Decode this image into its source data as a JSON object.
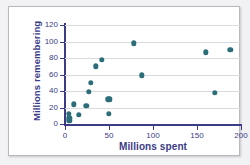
{
  "chart_data": {
    "type": "scatter",
    "title": "",
    "xlabel": "Millions spent",
    "ylabel": "Millions remembering",
    "xlim": [
      0,
      200
    ],
    "ylim": [
      0,
      120
    ],
    "xticks": [
      0,
      50,
      100,
      150,
      200
    ],
    "yticks": [
      0,
      20,
      40,
      60,
      80,
      100,
      120
    ],
    "grid": "horizontal",
    "legend": "none",
    "marker_color": "#2b6e79",
    "axis_color": "#3b3b86",
    "gridline_color": "#d9d9e0",
    "points": [
      {
        "x": 4,
        "y": 12
      },
      {
        "x": 5,
        "y": 7
      },
      {
        "x": 5,
        "y": 4
      },
      {
        "x": 10,
        "y": 24
      },
      {
        "x": 16,
        "y": 11
      },
      {
        "x": 24,
        "y": 22
      },
      {
        "x": 27,
        "y": 39
      },
      {
        "x": 29,
        "y": 50
      },
      {
        "x": 35,
        "y": 70
      },
      {
        "x": 42,
        "y": 78
      },
      {
        "x": 49,
        "y": 30
      },
      {
        "x": 51,
        "y": 30
      },
      {
        "x": 50,
        "y": 12
      },
      {
        "x": 78,
        "y": 98
      },
      {
        "x": 87,
        "y": 59
      },
      {
        "x": 160,
        "y": 87
      },
      {
        "x": 170,
        "y": 38
      },
      {
        "x": 188,
        "y": 90
      }
    ]
  }
}
